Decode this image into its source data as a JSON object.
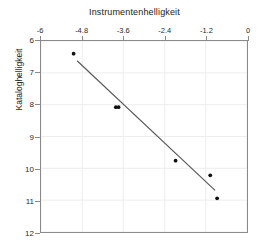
{
  "chart_data": {
    "type": "scatter",
    "title": "Instrumentenhelligkeit",
    "xlabel": "Instrumentenhelligkeit",
    "ylabel": "Kataloghelligkeit",
    "xlim": [
      -6,
      0
    ],
    "ylim": [
      12,
      6
    ],
    "x_axis_position": "top",
    "y_axis_inverted": true,
    "grid": true,
    "legend": null,
    "xticks": [
      -6,
      -4.8,
      -3.6,
      -2.4,
      -1.2,
      0
    ],
    "xtick_labels": [
      "-6",
      "-4.8",
      "-3.6",
      "-2.4",
      "-1.2",
      "0"
    ],
    "yticks": [
      6,
      7,
      8,
      9,
      10,
      11,
      12
    ],
    "ytick_labels": [
      "6",
      "7",
      "8",
      "9",
      "10",
      "11",
      "12"
    ],
    "series": [
      {
        "name": "Beobachtungen",
        "type": "scatter",
        "marker": "circle",
        "color": "#101010",
        "points": [
          {
            "x": -5.05,
            "y": 6.4
          },
          {
            "x": -3.82,
            "y": 8.08
          },
          {
            "x": -3.74,
            "y": 8.08
          },
          {
            "x": -2.08,
            "y": 9.76
          },
          {
            "x": -1.07,
            "y": 10.22
          },
          {
            "x": -0.87,
            "y": 10.94
          }
        ]
      },
      {
        "name": "Regressionsgerade",
        "type": "line",
        "color": "#555555",
        "points": [
          {
            "x": -4.95,
            "y": 6.62
          },
          {
            "x": -0.93,
            "y": 10.69
          }
        ]
      }
    ]
  },
  "axes": {
    "x_title": "Instrumentenhelligkeit",
    "y_title": "Kataloghelligkeit"
  },
  "colors": {
    "marker": "#101010",
    "fit_line": "#555555",
    "frame": "#8a8a8a",
    "grid": "#ededed",
    "background": "#ffffff"
  }
}
